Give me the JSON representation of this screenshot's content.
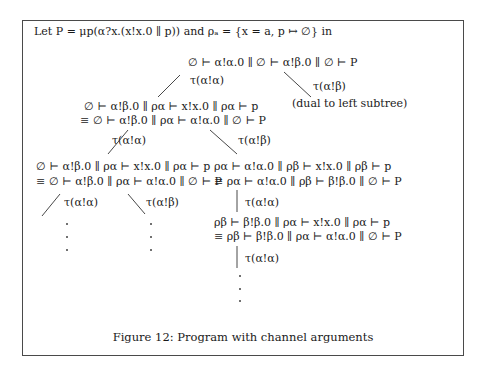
{
  "header": {
    "text": "Let P = μp(α?x.(x!x.0 || p)) and ρ_a = {x = a, p ↦ ∅} in",
    "display": "Let P = μp(α?x.(x!x.0 ∥ p)) and ρₐ = {x = a, p ↦ ∅} in"
  },
  "tree": {
    "root": "∅ ⊢ α!α.0 ∥ ∅ ⊢ α!β.0 ∥ ∅ ⊢ P",
    "root_left_label": "τ(α!α)",
    "root_right_label": "τ(α!β)",
    "root_right_child": "(dual to left subtree)",
    "l1": {
      "line1": "∅ ⊢ α!β.0 ∥ ρα ⊢ x!x.0 ∥ ρα ⊢ p",
      "line2": "≡ ∅ ⊢ α!β.0 ∥ ρα ⊢ α!α.0 ∥ ∅ ⊢ P",
      "left_label": "τ(α!α)",
      "right_label": "τ(α!β)"
    },
    "l2_left": {
      "line1": "∅ ⊢ α!β.0 ∥ ρα ⊢ x!x.0 ∥ ρα ⊢ p",
      "line2": "≡ ∅ ⊢ α!β.0 ∥ ρα ⊢ α!α.0 ∥ ∅ ⊢ P",
      "left_label": "τ(α!α)",
      "right_label": "τ(α!β)"
    },
    "l2_right": {
      "line1": "ρα ⊢ α!α.0 ∥ ρβ ⊢ x!x.0 ∥ ρβ ⊢ p",
      "line2": "≡ ρα ⊢ α!α.0 ∥ ρβ ⊢ β!β.0 ∥ ∅ ⊢ P",
      "down_label": "τ(α!α)"
    },
    "l3_right": {
      "line1": "ρβ ⊢ β!β.0 ∥ ρα ⊢ x!x.0 ∥ ρα ⊢ p",
      "line2": "≡ ρβ ⊢ β!β.0 ∥ ρα ⊢ α!α.0 ∥ ∅ ⊢ P",
      "down_label": "τ(α!α)"
    },
    "ellipsis": "⋮"
  },
  "caption": "Figure 12: Program with channel arguments"
}
